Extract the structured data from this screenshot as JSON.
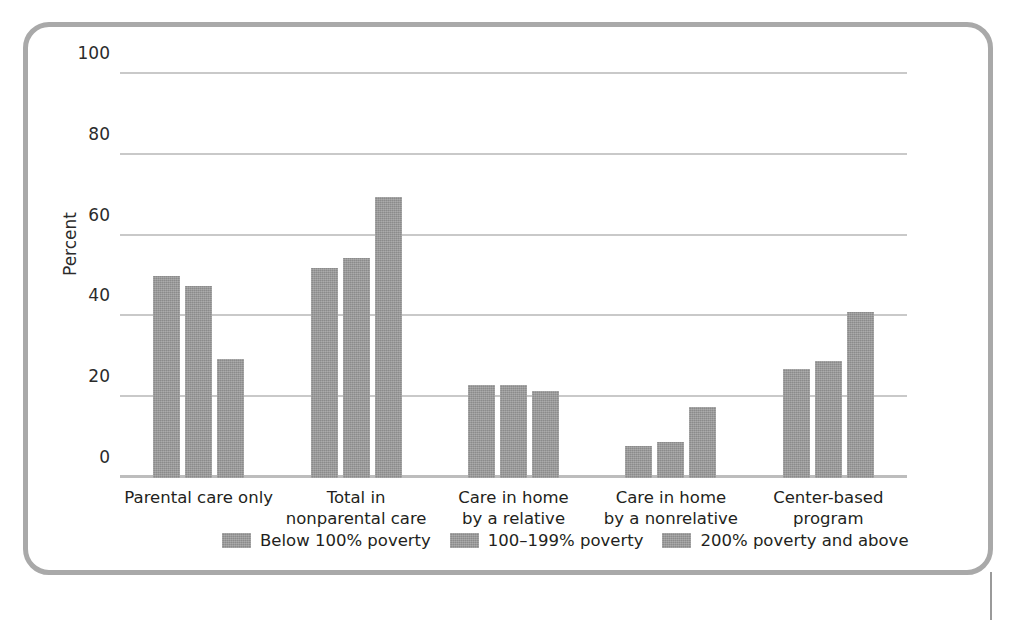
{
  "chart_data": {
    "type": "bar",
    "title": "",
    "xlabel": "",
    "ylabel": "Percent",
    "ylim": [
      0,
      100
    ],
    "yticks": [
      0,
      20,
      40,
      60,
      80,
      100
    ],
    "ytick_labels": [
      "0",
      "20",
      "40",
      "60",
      "80",
      "100"
    ],
    "grid": true,
    "legend_position": "bottom",
    "categories": [
      "Parental care only",
      "Total in\nnonparental care",
      "Care in home\nby a relative",
      "Care in home\nby a nonrelative",
      "Center-based\nprogram"
    ],
    "series": [
      {
        "name": "Below 100% poverty",
        "values": [
          50,
          52,
          23,
          8,
          27
        ]
      },
      {
        "name": "100–199% poverty",
        "values": [
          47.5,
          54.5,
          23,
          9,
          29
        ]
      },
      {
        "name": "200% poverty and above",
        "values": [
          29.5,
          69.5,
          21.5,
          17.5,
          41
        ]
      }
    ],
    "bar_color": "#989898",
    "gridline_color": "#c9c9c9",
    "frame_color": "#a9a9a9"
  }
}
